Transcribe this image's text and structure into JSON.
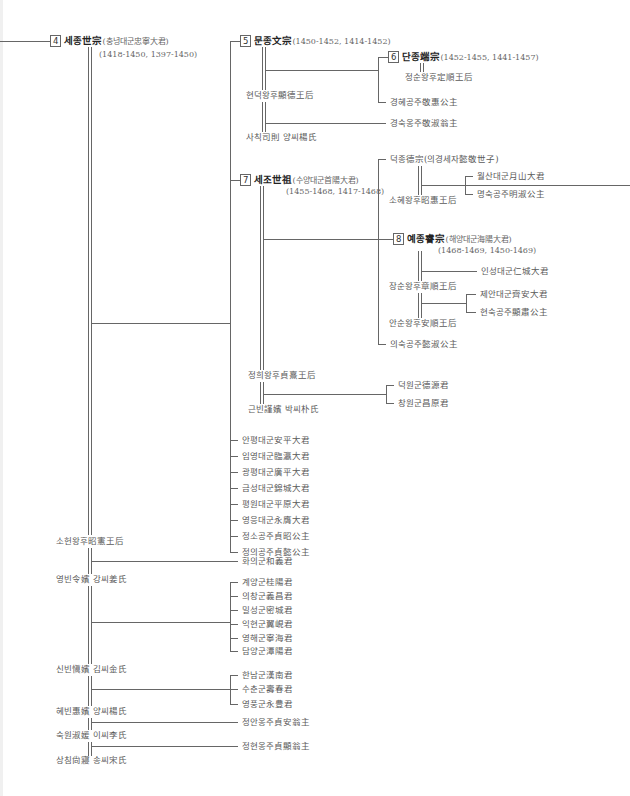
{
  "kings": [
    {
      "num": "4",
      "name": "세종世宗",
      "paren": "(충녕대군忠寧大君)",
      "dates": "(1418-1450, 1397-1450)"
    },
    {
      "num": "5",
      "name": "문종文宗",
      "paren": "(1450-1452, 1414-1452)",
      "dates": ""
    },
    {
      "num": "6",
      "name": "단종端宗",
      "paren": "(1452-1455, 1441-1457)",
      "dates": ""
    },
    {
      "num": "7",
      "name": "세조世祖",
      "paren": "(수양대군首陽大君)",
      "dates": "(1455-1468, 1417-1468)"
    },
    {
      "num": "8",
      "name": "예종睿宗",
      "paren": "(해양대군海陽大君)",
      "dates": "(1468-1469, 1450-1469)"
    }
  ],
  "munjong": {
    "consorts": [
      "현덕왕후顯德王后",
      "사칙司則 양씨楊氏"
    ],
    "children": [
      "정순왕후定順王后",
      "경혜공주敬惠公主",
      "경숙옹주敬淑翁主"
    ]
  },
  "sejo": {
    "deokjong": "덕종德宗(의경세자懿敬世子)",
    "deokjong_consort": "소혜왕후昭惠王后",
    "deokjong_children": [
      "월산대군月山大君",
      "명숙공주明淑公主"
    ],
    "yejong_consorts": [
      "장순왕후章順王后",
      "안순왕후安順王后"
    ],
    "yejong_children": [
      "인성대군仁城大君",
      "제안대군齊安大君",
      "현숙공주顯肅公主"
    ],
    "uisuk": "의숙공주懿淑公主",
    "consorts": [
      "정희왕후貞熹王后",
      "근빈謹嬪 박씨朴氏"
    ],
    "geunbin_children": [
      "덕원군德源君",
      "창원군昌原君"
    ]
  },
  "sejong_children_a": [
    "안평대군安平大君",
    "임영대군臨瀛大君",
    "광평대군廣平大君",
    "금성대군錦城大君",
    "평원대군平原大君",
    "영응대군永膺大君",
    "정소공주貞昭公主",
    "정의공주貞懿公主"
  ],
  "sejong_consorts": [
    "소헌왕후昭憲王后",
    "영빈令嬪 강씨姜氏",
    "신빈愼嬪 김씨金氏",
    "혜빈惠嬪 양씨楊氏",
    "숙원淑媛 이씨李氏",
    "상침尙寢 송씨宋氏"
  ],
  "yeongbin_child": "화의군和義君",
  "sinbin_children_a": [
    "계양군桂陽君",
    "의창군義昌君",
    "밀성군密城君",
    "익현군翼峴君",
    "영해군寧海君",
    "담양군潭陽君"
  ],
  "hyebin_children": [
    "한남군漢南君",
    "수춘군壽春君",
    "영풍군永豊君"
  ],
  "sugwon_child": "정안옹주貞安翁主",
  "sangchim_child": "정현옹주貞顯翁主"
}
